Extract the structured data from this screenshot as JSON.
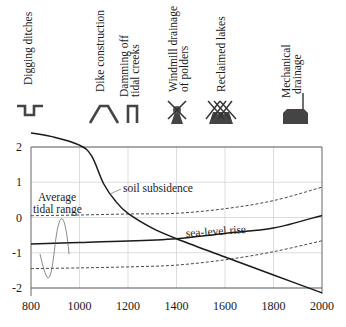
{
  "chart_data": {
    "type": "line",
    "title": "",
    "xlabel": "",
    "ylabel": "",
    "xlim": [
      800,
      2000
    ],
    "ylim": [
      -2,
      2
    ],
    "x_ticks": [
      800,
      1000,
      1200,
      1400,
      1600,
      1800,
      2000
    ],
    "y_ticks": [
      2,
      1,
      0,
      -1,
      -2
    ],
    "grid": true,
    "series": [
      {
        "name": "soil subsidence",
        "style": "solid",
        "x": [
          800,
          900,
          1000,
          1050,
          1100,
          1150,
          1200,
          1300,
          1400,
          1600,
          1800,
          2000
        ],
        "values": [
          2.4,
          2.27,
          2.05,
          1.75,
          0.95,
          0.45,
          0.12,
          -0.3,
          -0.6,
          -1.12,
          -1.63,
          -2.14
        ]
      },
      {
        "name": "sea-level rise",
        "style": "solid",
        "x": [
          800,
          1000,
          1200,
          1400,
          1600,
          1800,
          2000
        ],
        "values": [
          -0.75,
          -0.71,
          -0.67,
          -0.6,
          -0.45,
          -0.3,
          0.06
        ]
      },
      {
        "name": "average tidal range upper (high water)",
        "style": "dashed",
        "x": [
          800,
          1000,
          1200,
          1400,
          1600,
          1800,
          2000
        ],
        "values": [
          0.05,
          0.07,
          0.1,
          0.12,
          0.25,
          0.48,
          0.86
        ]
      },
      {
        "name": "average tidal range lower (low water)",
        "style": "dashed",
        "x": [
          800,
          1000,
          1200,
          1400,
          1600,
          1800,
          2000
        ],
        "values": [
          -1.45,
          -1.43,
          -1.4,
          -1.35,
          -1.2,
          -0.97,
          -0.66
        ]
      }
    ],
    "annotations": [
      {
        "text": "soil subsidence",
        "x": 1250,
        "y": 1.6
      },
      {
        "text": "sea-level rise",
        "x": 1450,
        "y": -0.45
      },
      {
        "text": "Average",
        "x": 920,
        "y": 0.55
      },
      {
        "text": "tidal range",
        "x": 920,
        "y": 0.2
      }
    ],
    "events": [
      {
        "label": "Digging ditches",
        "icon": "ditch-icon",
        "x": 825
      },
      {
        "label": "Dike construction",
        "icon": "dike-icon",
        "x": 1100
      },
      {
        "label": "Damming off tidal creeks",
        "icon": "dam-icon",
        "x": 1180
      },
      {
        "label": "Windmill drainage of polders",
        "icon": "windmill-icon",
        "x": 1380
      },
      {
        "label": "Reclaimed lakes",
        "icon": "windmills-group-icon",
        "x": 1500
      },
      {
        "label": "Mechanical drainage",
        "icon": "pumping-station-icon",
        "x": 1750
      }
    ]
  },
  "labels": {
    "event_1": "Digging ditches",
    "event_2": "Dike construction",
    "event_3a": "Damming off",
    "event_3b": "tidal creeks",
    "event_4a": "Windmill drainage",
    "event_4b": "of polders",
    "event_5": "Reclaimed lakes",
    "event_6a": "Mechanical",
    "event_6b": "drainage",
    "soil_subsidence": "soil subsidence",
    "sea_level_rise": "sea-level rise",
    "tidal_1": "Average",
    "tidal_2": "tidal range"
  },
  "ticks": {
    "x": [
      "800",
      "1000",
      "1200",
      "1400",
      "1600",
      "1800",
      "2000"
    ],
    "y": [
      "2",
      "1",
      "0",
      "-1",
      "-2"
    ]
  },
  "colors": {
    "line": "#1a1a1a",
    "grid": "#d0d0d0",
    "frame": "#555555",
    "icon": "#444444"
  }
}
